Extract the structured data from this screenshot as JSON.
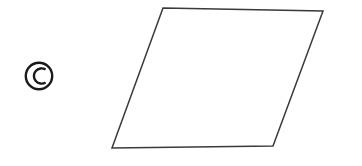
{
  "figure": {
    "label": {
      "icon": "circled-letter-c-icon",
      "letter": "C",
      "symbol": "©",
      "color": "#1a1a1a",
      "center_x": 39,
      "center_y": 76,
      "radius": 13.5
    },
    "shape": {
      "name": "parallelogram",
      "stroke_color": "#3a3a3a",
      "fill_color": "#ffffff",
      "stroke_width": 1.5,
      "vertices": [
        {
          "name": "top-left",
          "x": 163,
          "y": 8
        },
        {
          "name": "top-right",
          "x": 323,
          "y": 11
        },
        {
          "name": "bottom-right",
          "x": 273,
          "y": 146
        },
        {
          "name": "bottom-left",
          "x": 112,
          "y": 148
        }
      ],
      "points": "163,8 323,11 273,146 112,148"
    },
    "canvas": {
      "width": 362,
      "height": 166,
      "background": "#ffffff"
    }
  }
}
